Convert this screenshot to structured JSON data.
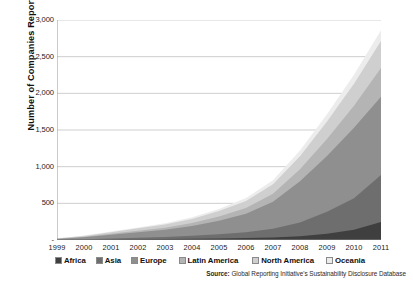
{
  "chart_data": {
    "type": "area",
    "stacked": true,
    "title": "",
    "xlabel": "",
    "ylabel": "Number of Companies Reporting",
    "categories": [
      "1999",
      "2000",
      "2001",
      "2002",
      "2003",
      "2004",
      "2005",
      "2006",
      "2007",
      "2008",
      "2009",
      "2010",
      "2011"
    ],
    "x": [
      1999,
      2000,
      2001,
      2002,
      2003,
      2004,
      2005,
      2006,
      2007,
      2008,
      2009,
      2010,
      2011
    ],
    "ylim": [
      0,
      3000
    ],
    "yticks": [
      0,
      500,
      1000,
      1500,
      2000,
      2500,
      3000
    ],
    "ytick_labels": [
      "-",
      "500",
      "1,000",
      "1,500",
      "2,000",
      "2,500",
      "3,000"
    ],
    "grid": "horizontal",
    "legend_position": "bottom",
    "series": [
      {
        "name": "Africa",
        "color": "#3f3f3f",
        "values": [
          2,
          4,
          6,
          9,
          12,
          16,
          20,
          26,
          34,
          52,
          86,
          140,
          245
        ]
      },
      {
        "name": "Asia",
        "color": "#6e6e6e",
        "values": [
          3,
          7,
          14,
          22,
          30,
          42,
          58,
          80,
          118,
          188,
          300,
          430,
          640
        ]
      },
      {
        "name": "Europe",
        "color": "#8f8f8f",
        "values": [
          10,
          26,
          52,
          76,
          98,
          134,
          186,
          252,
          368,
          560,
          760,
          960,
          1070
        ]
      },
      {
        "name": "Latin America",
        "color": "#b4b4b4",
        "values": [
          2,
          6,
          12,
          20,
          28,
          40,
          56,
          78,
          112,
          165,
          230,
          300,
          390
        ]
      },
      {
        "name": "North America",
        "color": "#cfcfcf",
        "values": [
          5,
          12,
          22,
          32,
          42,
          56,
          74,
          96,
          128,
          178,
          240,
          300,
          370
        ]
      },
      {
        "name": "Oceania",
        "color": "#ececec",
        "values": [
          2,
          5,
          9,
          13,
          17,
          23,
          30,
          40,
          54,
          76,
          100,
          124,
          145
        ]
      }
    ],
    "totals": [
      24,
      60,
      115,
      172,
      227,
      311,
      424,
      572,
      814,
      1219,
      1716,
      2254,
      2860
    ],
    "source_prefix": "Source:",
    "source_text": "Global Reporting Initiative's  Sustainability Disclosure Database"
  },
  "legend": {
    "items": [
      {
        "label": "Africa",
        "swatch": "#3f3f3f"
      },
      {
        "label": "Asia",
        "swatch": "#6e6e6e"
      },
      {
        "label": "Europe",
        "swatch": "#8f8f8f"
      },
      {
        "label": "Latin America",
        "swatch": "#b4b4b4"
      },
      {
        "label": "North America",
        "swatch": "#cfcfcf"
      },
      {
        "label": "Oceania",
        "swatch": "#ececec"
      }
    ]
  }
}
